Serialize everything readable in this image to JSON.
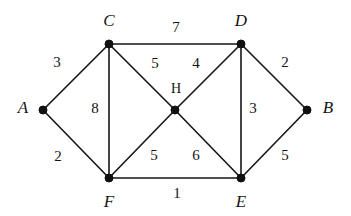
{
  "figure": {
    "name": "weighted-undirected-graph",
    "background_color": "#ffffff",
    "ink_color": "#151515"
  },
  "chart_data": {
    "type": "diagram",
    "title": "",
    "xlabel": "",
    "ylabel": "",
    "graph_kind": "weighted undirected graph",
    "nodes": [
      {
        "id": "A",
        "label": "A",
        "x": 43,
        "y": 110,
        "label_x": 23,
        "label_y": 107,
        "label_style": "italic"
      },
      {
        "id": "B",
        "label": "B",
        "x": 307,
        "y": 110,
        "label_x": 328,
        "label_y": 107,
        "label_style": "italic"
      },
      {
        "id": "C",
        "label": "C",
        "x": 109,
        "y": 44,
        "label_x": 109,
        "label_y": 20,
        "label_style": "italic"
      },
      {
        "id": "D",
        "label": "D",
        "x": 241,
        "y": 44,
        "label_x": 241,
        "label_y": 20,
        "label_style": "italic"
      },
      {
        "id": "E",
        "label": "E",
        "x": 241,
        "y": 178,
        "label_x": 241,
        "label_y": 201,
        "label_style": "italic"
      },
      {
        "id": "F",
        "label": "F",
        "x": 109,
        "y": 178,
        "label_x": 109,
        "label_y": 201,
        "label_style": "italic"
      },
      {
        "id": "H",
        "label": "H",
        "x": 175,
        "y": 110,
        "label_x": 176,
        "label_y": 89,
        "label_style": "upright"
      }
    ],
    "edges": [
      {
        "from": "A",
        "to": "C",
        "weight": 3,
        "label_x": 57,
        "label_y": 62
      },
      {
        "from": "A",
        "to": "F",
        "weight": 2,
        "label_x": 58,
        "label_y": 156
      },
      {
        "from": "C",
        "to": "D",
        "weight": 7,
        "label_x": 176,
        "label_y": 27
      },
      {
        "from": "C",
        "to": "F",
        "weight": 8,
        "label_x": 95,
        "label_y": 108
      },
      {
        "from": "C",
        "to": "H",
        "weight": 5,
        "label_x": 155,
        "label_y": 63
      },
      {
        "from": "D",
        "to": "H",
        "weight": 4,
        "label_x": 196,
        "label_y": 63
      },
      {
        "from": "D",
        "to": "B",
        "weight": 2,
        "label_x": 285,
        "label_y": 62
      },
      {
        "from": "D",
        "to": "E",
        "weight": 3,
        "label_x": 253,
        "label_y": 108
      },
      {
        "from": "F",
        "to": "H",
        "weight": 5,
        "label_x": 154,
        "label_y": 155
      },
      {
        "from": "H",
        "to": "E",
        "weight": 6,
        "label_x": 196,
        "label_y": 155
      },
      {
        "from": "F",
        "to": "E",
        "weight": 1,
        "label_x": 177,
        "label_y": 193
      },
      {
        "from": "E",
        "to": "B",
        "weight": 5,
        "label_x": 285,
        "label_y": 155
      }
    ],
    "node_radius": 4,
    "legend": [],
    "annotations": []
  }
}
